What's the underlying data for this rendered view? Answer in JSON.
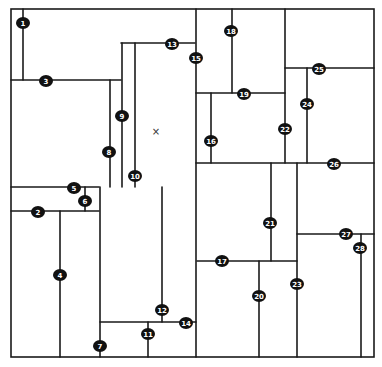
{
  "diagram": {
    "type": "rectangular-subdivision-floorplan",
    "stroke_color": "#1a1a1a",
    "badge_color": "#111111",
    "badge_text_color": "#ffffff",
    "outer_border": {
      "x1": 11,
      "y1": 9,
      "x2": 374,
      "y2": 357
    },
    "marker": {
      "symbol": "×",
      "x": 156,
      "y": 131
    },
    "segments": [
      {
        "id": 1,
        "orient": "v",
        "x": 23,
        "y1": 9,
        "y2": 80,
        "label": {
          "x": 23,
          "y": 23
        }
      },
      {
        "id": 2,
        "orient": "h",
        "y": 211,
        "x1": 11,
        "x2": 99,
        "label": {
          "x": 38,
          "y": 212
        }
      },
      {
        "id": 3,
        "orient": "h",
        "y": 80,
        "x1": 11,
        "x2": 121,
        "label": {
          "x": 46,
          "y": 81
        }
      },
      {
        "id": 4,
        "orient": "v",
        "x": 60,
        "y1": 211,
        "y2": 357,
        "label": {
          "x": 60,
          "y": 275
        }
      },
      {
        "id": 5,
        "orient": "h",
        "y": 187,
        "x1": 11,
        "x2": 99,
        "label": {
          "x": 74,
          "y": 188
        }
      },
      {
        "id": 6,
        "orient": "v",
        "x": 85,
        "y1": 187,
        "y2": 211,
        "label": {
          "x": 85,
          "y": 201
        }
      },
      {
        "id": 7,
        "orient": "v",
        "x": 100,
        "y1": 187,
        "y2": 357,
        "label": {
          "x": 100,
          "y": 346
        }
      },
      {
        "id": 8,
        "orient": "v",
        "x": 110,
        "y1": 80,
        "y2": 187,
        "label": {
          "x": 109,
          "y": 152
        }
      },
      {
        "id": 9,
        "orient": "v",
        "x": 122,
        "y1": 43,
        "y2": 187,
        "label": {
          "x": 122,
          "y": 116
        }
      },
      {
        "id": 10,
        "orient": "v",
        "x": 135,
        "y1": 43,
        "y2": 187,
        "label": {
          "x": 135,
          "y": 176
        }
      },
      {
        "id": 11,
        "orient": "v",
        "x": 148,
        "y1": 322,
        "y2": 357,
        "label": {
          "x": 148,
          "y": 334
        }
      },
      {
        "id": 12,
        "orient": "v",
        "x": 162,
        "y1": 187,
        "y2": 322,
        "label": {
          "x": 162,
          "y": 310
        }
      },
      {
        "id": 13,
        "orient": "h",
        "y": 43,
        "x1": 121,
        "x2": 195,
        "label": {
          "x": 172,
          "y": 44
        }
      },
      {
        "id": 14,
        "orient": "h",
        "y": 322,
        "x1": 100,
        "x2": 196,
        "label": {
          "x": 186,
          "y": 323
        }
      },
      {
        "id": 15,
        "orient": "v",
        "x": 196,
        "y1": 9,
        "y2": 357,
        "label": {
          "x": 196,
          "y": 58
        }
      },
      {
        "id": 16,
        "orient": "v",
        "x": 211,
        "y1": 93,
        "y2": 163,
        "label": {
          "x": 211,
          "y": 141
        }
      },
      {
        "id": 17,
        "orient": "h",
        "y": 261,
        "x1": 197,
        "x2": 297,
        "label": {
          "x": 222,
          "y": 261
        }
      },
      {
        "id": 18,
        "orient": "v",
        "x": 232,
        "y1": 9,
        "y2": 93,
        "label": {
          "x": 231,
          "y": 31
        }
      },
      {
        "id": 19,
        "orient": "h",
        "y": 93,
        "x1": 196,
        "x2": 285,
        "label": {
          "x": 244,
          "y": 94
        }
      },
      {
        "id": 20,
        "orient": "v",
        "x": 259,
        "y1": 261,
        "y2": 357,
        "label": {
          "x": 259,
          "y": 296
        }
      },
      {
        "id": 21,
        "orient": "v",
        "x": 271,
        "y1": 163,
        "y2": 261,
        "label": {
          "x": 270,
          "y": 223
        }
      },
      {
        "id": 22,
        "orient": "v",
        "x": 285,
        "y1": 9,
        "y2": 163,
        "label": {
          "x": 285,
          "y": 129
        }
      },
      {
        "id": 23,
        "orient": "v",
        "x": 297,
        "y1": 163,
        "y2": 357,
        "label": {
          "x": 297,
          "y": 284
        }
      },
      {
        "id": 24,
        "orient": "v",
        "x": 307,
        "y1": 68,
        "y2": 163,
        "label": {
          "x": 307,
          "y": 104
        }
      },
      {
        "id": 25,
        "orient": "h",
        "y": 68,
        "x1": 285,
        "x2": 374,
        "label": {
          "x": 319,
          "y": 69
        }
      },
      {
        "id": 26,
        "orient": "h",
        "y": 163,
        "x1": 196,
        "x2": 374,
        "label": {
          "x": 334,
          "y": 164
        }
      },
      {
        "id": 27,
        "orient": "h",
        "y": 234,
        "x1": 297,
        "x2": 374,
        "label": {
          "x": 346,
          "y": 234
        }
      },
      {
        "id": 28,
        "orient": "v",
        "x": 361,
        "y1": 234,
        "y2": 357,
        "label": {
          "x": 360,
          "y": 248
        }
      }
    ]
  }
}
